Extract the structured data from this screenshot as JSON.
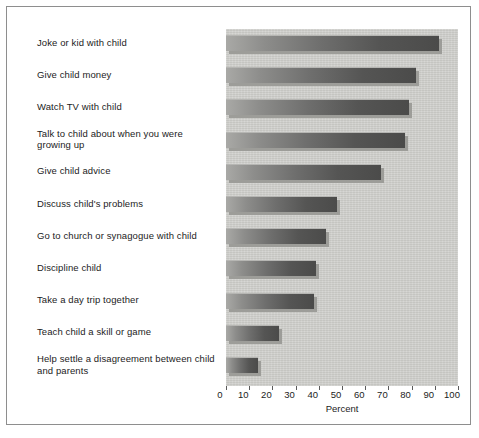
{
  "figure": {
    "background_color": "#ffffff",
    "frame_color": "#8e8e8e",
    "panel_color": "#cfcfcb",
    "bar_color_dark": "#4b4b4a",
    "bar_color_light": "#a9a9a6",
    "bar_shadow_color": "#9d9d99",
    "text_color": "#1c1c1c"
  },
  "chart_data": {
    "type": "bar",
    "orientation": "horizontal",
    "title": "",
    "subtitle": "",
    "xlabel": "Percent",
    "ylabel": "",
    "xlim": [
      0,
      100
    ],
    "ylim": null,
    "grid": false,
    "legend": null,
    "legend_position": "none",
    "xticks": [
      0,
      10,
      20,
      30,
      40,
      50,
      60,
      70,
      80,
      90,
      100
    ],
    "xticklabels": [
      "0",
      "10",
      "20",
      "30",
      "40",
      "50",
      "60",
      "70",
      "80",
      "90",
      "100"
    ],
    "categories": [
      "Joke or kid with child",
      "Give child money",
      "Watch TV with child",
      "Talk to child about when you were growing up",
      "Give child advice",
      "Discuss child's problems",
      "Go to church or synagogue with child",
      "Discipline child",
      "Take a day trip together",
      "Teach child a skill or game",
      "Help settle a disagreement between child and parents"
    ],
    "values": [
      92,
      82,
      79,
      77,
      67,
      48,
      43,
      39,
      38,
      23,
      14
    ],
    "annotations": []
  }
}
